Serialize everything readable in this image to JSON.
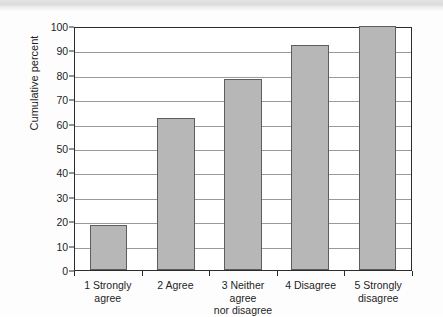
{
  "chart_data": {
    "type": "bar",
    "title": "",
    "xlabel": "",
    "ylabel": "Cumulative percent",
    "categories": [
      "1 Strongly agree",
      "2 Agree",
      "3 Neither agree nor disagree",
      "4 Disagree",
      "5 Strongly disagree"
    ],
    "category_lines": [
      [
        "1 Strongly agree",
        ""
      ],
      [
        "2 Agree",
        ""
      ],
      [
        "3 Neither agree",
        "nor disagree"
      ],
      [
        "4 Disagree",
        ""
      ],
      [
        "5 Strongly",
        "disagree"
      ]
    ],
    "values": [
      18.6,
      62.2,
      78.3,
      92.4,
      100
    ],
    "ylim": [
      0,
      100
    ],
    "ytick_step": 10,
    "yticks": [
      0,
      10,
      20,
      30,
      40,
      50,
      60,
      70,
      80,
      90,
      100
    ],
    "ytick_labels": [
      "0",
      "10",
      "20",
      "30",
      "40",
      "50",
      "60",
      "70",
      "80",
      "90",
      "100"
    ],
    "grid": true,
    "grid_axis": "y",
    "legend": false,
    "legend_position": "none",
    "bar_fill_color": "#b7b7b7",
    "bar_border_color": "#5d5d5d",
    "axis_color": "#2b2b2b",
    "grid_color": "#9a9a9a",
    "background_color": "#ffffff"
  }
}
